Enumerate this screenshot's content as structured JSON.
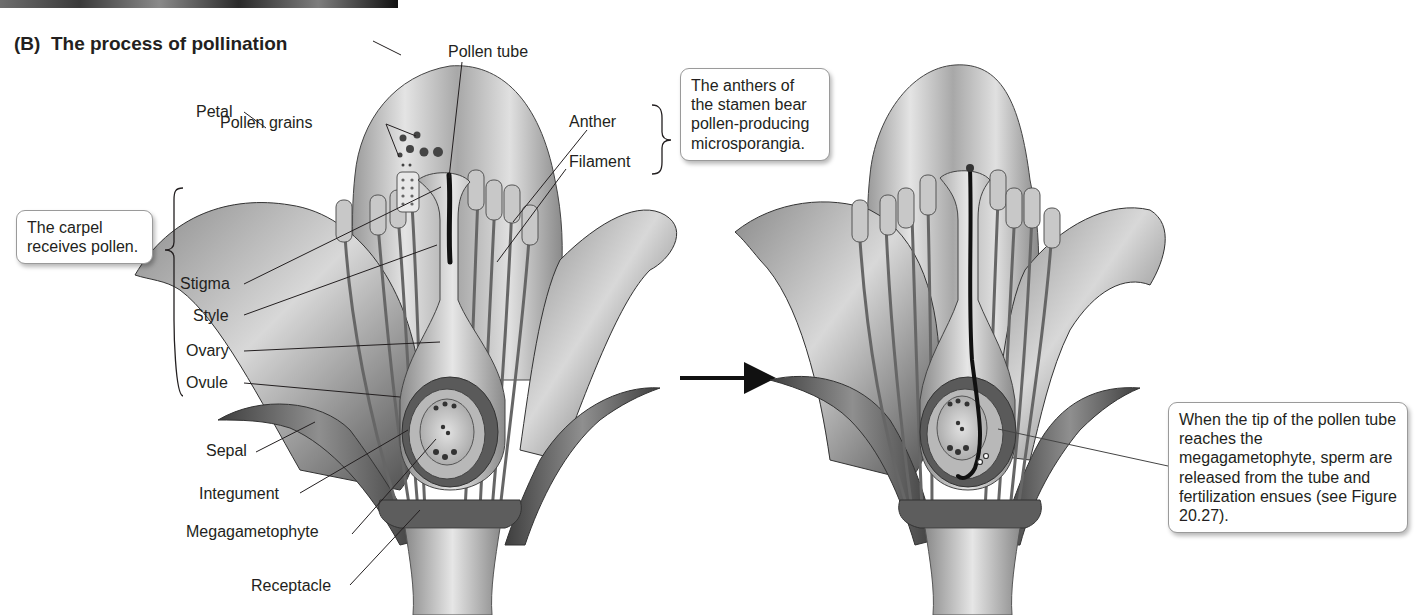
{
  "figure": {
    "top_photo_credit": "© © ©",
    "panel_label": "(B)",
    "panel_title": "The process of pollination"
  },
  "left_flower": {
    "labels": {
      "pollen_tube": "Pollen tube",
      "pollen_grains": "Pollen grains",
      "anther": "Anther",
      "filament": "Filament",
      "petal": "Petal",
      "stigma": "Stigma",
      "style": "Style",
      "ovary": "Ovary",
      "ovule": "Ovule",
      "sepal": "Sepal",
      "integument": "Integument",
      "megagametophyte": "Megagametophyte",
      "receptacle": "Receptacle"
    },
    "carpel_group": [
      "Stigma",
      "Style",
      "Ovary",
      "Ovule"
    ],
    "stamen_group": [
      "Anther",
      "Filament"
    ]
  },
  "callouts": {
    "carpel": "The carpel receives pollen.",
    "stamen": "The anthers of the stamen bear pollen-producing microsporangia.",
    "fertilization": "When the tip of the pollen tube reaches the megagametophyte, sperm are released from the tube and fertilization ensues (see Figure 20.27)."
  },
  "transition": {
    "arrow": "right-arrow-icon"
  },
  "colors": {
    "text": "#231f20",
    "callout_border": "#9a9a9a",
    "leader_line": "#231f20",
    "pollen_tube": "#111111",
    "petal_dark": "#4a4a4a",
    "petal_light": "#d6d6d6"
  }
}
